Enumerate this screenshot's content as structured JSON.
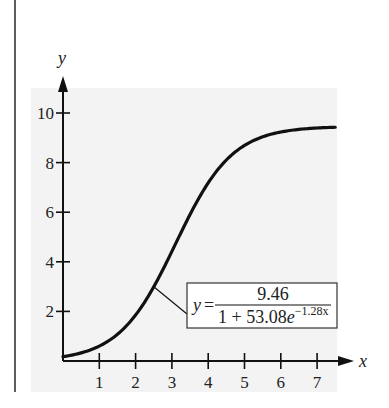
{
  "chart_data": {
    "type": "line",
    "title": "",
    "xlabel": "x",
    "ylabel": "y",
    "xlim": [
      0,
      7.5
    ],
    "ylim": [
      0,
      11
    ],
    "x_ticks": [
      1,
      2,
      3,
      4,
      5,
      6,
      7
    ],
    "y_ticks": [
      2,
      4,
      6,
      8,
      10
    ],
    "grid": false,
    "legend": null,
    "series": [
      {
        "name": "logistic model",
        "equation": "y = 9.46 / (1 + 53.08e^(-1.28x))",
        "x": [
          0,
          0.5,
          1,
          1.5,
          2,
          2.5,
          3,
          3.5,
          4,
          4.5,
          5,
          5.5,
          6,
          6.5,
          7,
          7.5
        ],
        "values": [
          0.17,
          0.33,
          0.62,
          1.14,
          1.99,
          3.24,
          4.77,
          6.27,
          7.5,
          8.34,
          8.85,
          9.14,
          9.3,
          9.38,
          9.42,
          9.44
        ]
      }
    ],
    "annotations": [
      {
        "text": "y = 9.46 / (1 + 53.08e^(-1.28x))",
        "lhs": "y =",
        "numerator": "9.46",
        "denominator_base": "1 + 53.08",
        "denominator_e": "e",
        "denominator_exp": "−1.28x",
        "points_to_x": 2.5
      }
    ]
  },
  "axes": {
    "x_label": "x",
    "y_label": "y",
    "x_tick_labels": [
      "1",
      "2",
      "3",
      "4",
      "5",
      "6",
      "7"
    ],
    "y_tick_labels": [
      "2",
      "4",
      "6",
      "8",
      "10"
    ]
  },
  "colors": {
    "panel": "#f3f3f3",
    "ink": "#111111",
    "page": "#ffffff"
  }
}
